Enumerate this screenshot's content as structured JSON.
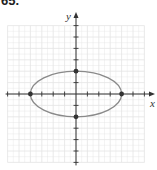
{
  "problem": {
    "number": "65."
  },
  "chart_data": {
    "type": "line",
    "title": "",
    "xlabel": "x",
    "ylabel": "y",
    "xlim": [
      -6,
      6
    ],
    "ylim": [
      -6,
      6
    ],
    "grid": true,
    "tick_spacing": 1,
    "curve": {
      "kind": "ellipse",
      "equation": "x^2/16 + y^2/4 = 1",
      "center": [
        0,
        0
      ],
      "semi_x": 4,
      "semi_y": 2
    },
    "points": [
      {
        "x": -4,
        "y": 0
      },
      {
        "x": 4,
        "y": 0
      },
      {
        "x": 0,
        "y": 2
      },
      {
        "x": 0,
        "y": -2
      }
    ]
  },
  "style": {
    "grid_color": "#e4e4e4",
    "axis_color": "#333333",
    "curve_color": "#8a8a8a",
    "point_color": "#333333"
  }
}
